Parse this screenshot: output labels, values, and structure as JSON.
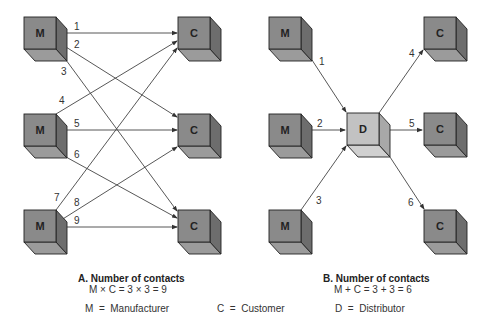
{
  "colors": {
    "cube_front": "#8c8c8c",
    "cube_side": "#6e6e6e",
    "cube_bottom": "#9e9e9e",
    "customer_front": "#7f7f7f",
    "distributor_front": "#c4c4c4",
    "distributor_side": "#a8a8a8",
    "distributor_bottom": "#d2d2d2",
    "line": "#444444"
  },
  "diagram_a": {
    "manufacturers": [
      {
        "label": "M",
        "x": 24,
        "y": 17
      },
      {
        "label": "M",
        "x": 24,
        "y": 114
      },
      {
        "label": "M",
        "x": 24,
        "y": 210
      }
    ],
    "customers": [
      {
        "label": "C",
        "x": 178,
        "y": 17
      },
      {
        "label": "C",
        "x": 178,
        "y": 114
      },
      {
        "label": "C",
        "x": 178,
        "y": 210
      }
    ],
    "contacts": [
      {
        "number": "1",
        "from": 0,
        "to": 0
      },
      {
        "number": "2",
        "from": 0,
        "to": 1
      },
      {
        "number": "3",
        "from": 0,
        "to": 2
      },
      {
        "number": "4",
        "from": 1,
        "to": 0
      },
      {
        "number": "5",
        "from": 1,
        "to": 1
      },
      {
        "number": "6",
        "from": 1,
        "to": 2
      },
      {
        "number": "7",
        "from": 2,
        "to": 0
      },
      {
        "number": "8",
        "from": 2,
        "to": 1
      },
      {
        "number": "9",
        "from": 2,
        "to": 2
      }
    ],
    "caption_title": "A. Number of contacts",
    "caption_equation": "M × C = 3 × 3 = 9"
  },
  "diagram_b": {
    "manufacturers": [
      {
        "label": "M",
        "x": 269,
        "y": 17
      },
      {
        "label": "M",
        "x": 269,
        "y": 114
      },
      {
        "label": "M",
        "x": 269,
        "y": 210
      }
    ],
    "distributor": {
      "label": "D",
      "x": 347,
      "y": 113
    },
    "customers": [
      {
        "label": "C",
        "x": 424,
        "y": 17
      },
      {
        "label": "C",
        "x": 424,
        "y": 113
      },
      {
        "label": "C",
        "x": 424,
        "y": 210
      }
    ],
    "contacts": [
      {
        "number": "1"
      },
      {
        "number": "2"
      },
      {
        "number": "3"
      },
      {
        "number": "4"
      },
      {
        "number": "5"
      },
      {
        "number": "6"
      }
    ],
    "caption_title": "B. Number of contacts",
    "caption_equation": "M + C = 3 + 3 = 6"
  },
  "legend": {
    "manufacturer": "M  =  Manufacturer",
    "customer": "C  =  Customer",
    "distributor": "D  =  Distributor"
  }
}
